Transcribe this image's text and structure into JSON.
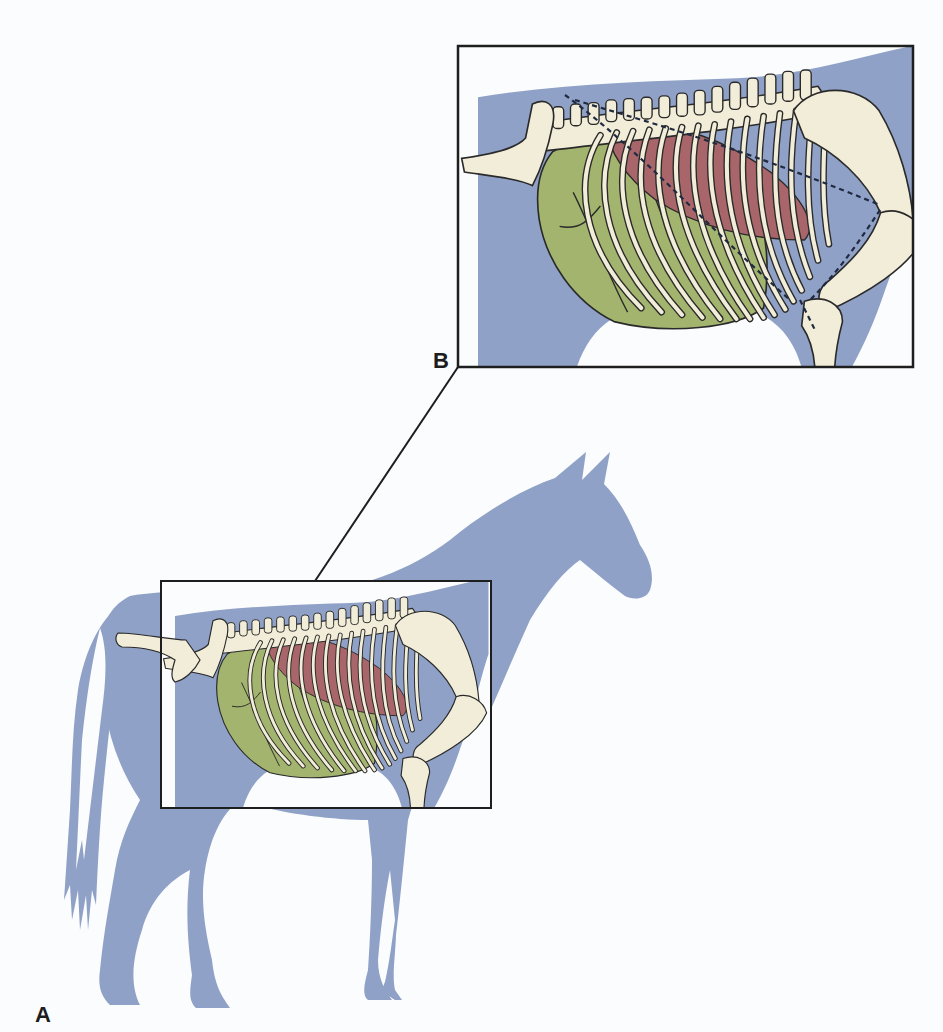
{
  "figure": {
    "panels": [
      {
        "id": "A",
        "label": "A",
        "description": "Full horse silhouette with inset frame over thorax"
      },
      {
        "id": "B",
        "label": "B",
        "description": "Enlarged view of thoracic skeleton, lung and abdominal viscera"
      }
    ],
    "colors": {
      "silhouette": "#8fa1c6",
      "bone": "#f1edd8",
      "lung": "#a8666a",
      "viscera": "#a2b46e",
      "outline": "#2a2a2a",
      "frame": "#1e1e1e",
      "background": "#fbfcfd"
    },
    "legend_items": [
      {
        "name": "lung",
        "color": "#a8666a"
      },
      {
        "name": "abdominal viscera",
        "color": "#a2b46e"
      },
      {
        "name": "bone",
        "color": "#f1edd8"
      }
    ]
  }
}
